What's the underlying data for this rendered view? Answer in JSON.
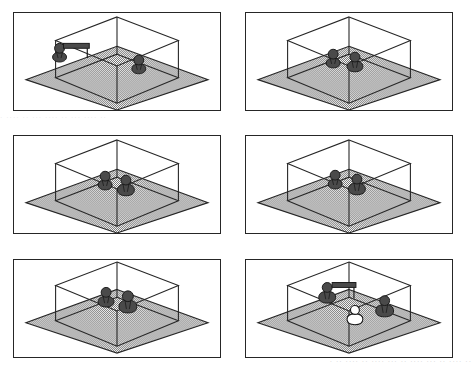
{
  "document": {
    "title": "Isometric cube scenes with pawn figures",
    "layout": "2 columns x 3 rows grid of bordered panels",
    "width": 476,
    "height": 371
  },
  "style": {
    "background_color": "#ffffff",
    "line_color": "#262626",
    "panel_border_color": "#262626",
    "floor_fill": "#8a8a8a",
    "floor_pattern": "dithered-checkerboard-gray",
    "pawn_dark_fill": "#4a4a4a",
    "pawn_light_fill": "#ffffff",
    "pawn_outline": "#1a1a1a"
  },
  "scene_common": {
    "cube_label": "wireframe-cube",
    "floor_label": "ground-plane-diamond",
    "projection": "isometric",
    "cube_edges": 12,
    "notes": "Transparent wireframe box sits on a larger shaded ground diamond."
  },
  "panels": [
    {
      "id": "panel-1",
      "position": "row1-col1",
      "figure_count": 2,
      "figures": [
        {
          "name": "pawn-dark-left",
          "color": "dark",
          "x": 46,
          "y": 50,
          "scale": 1.0,
          "has_bar": true,
          "bar_label": "horizontal-connector-bar"
        },
        {
          "name": "pawn-dark-right",
          "color": "dark",
          "x": 126,
          "y": 62,
          "scale": 1.0,
          "has_bar": false
        }
      ],
      "arrangement": "two pawns far apart, left pawn carries a bar"
    },
    {
      "id": "panel-2",
      "position": "row1-col2",
      "figure_count": 2,
      "figures": [
        {
          "name": "pawn-dark-left",
          "color": "dark",
          "x": 88,
          "y": 56,
          "scale": 1.0,
          "has_bar": false
        },
        {
          "name": "pawn-dark-right",
          "color": "dark",
          "x": 110,
          "y": 60,
          "scale": 1.0,
          "has_bar": false
        }
      ],
      "arrangement": "two pawns adjacent at centre"
    },
    {
      "id": "panel-3",
      "position": "row2-col1",
      "figure_count": 2,
      "figures": [
        {
          "name": "pawn-dark-left",
          "color": "dark",
          "x": 92,
          "y": 55,
          "scale": 1.0,
          "has_bar": false
        },
        {
          "name": "pawn-dark-right",
          "color": "dark",
          "x": 113,
          "y": 61,
          "scale": 1.05,
          "has_bar": false
        }
      ],
      "arrangement": "two pawns adjacent, right one slightly forward"
    },
    {
      "id": "panel-4",
      "position": "row2-col2",
      "figure_count": 2,
      "figures": [
        {
          "name": "pawn-dark-left",
          "color": "dark",
          "x": 90,
          "y": 54,
          "scale": 1.0,
          "has_bar": false
        },
        {
          "name": "pawn-dark-right",
          "color": "dark",
          "x": 112,
          "y": 60,
          "scale": 1.05,
          "has_bar": false
        }
      ],
      "arrangement": "two pawns adjacent at centre"
    },
    {
      "id": "panel-5",
      "position": "row3-col1",
      "figure_count": 2,
      "figures": [
        {
          "name": "pawn-dark-left",
          "color": "dark",
          "x": 93,
          "y": 48,
          "scale": 1.0,
          "has_bar": false
        },
        {
          "name": "pawn-dark-right",
          "color": "dark",
          "x": 115,
          "y": 54,
          "scale": 1.05,
          "has_bar": false
        }
      ],
      "arrangement": "two pawns adjacent, raised position"
    },
    {
      "id": "panel-6",
      "position": "row3-col2",
      "figure_count": 3,
      "figures": [
        {
          "name": "pawn-dark-back",
          "color": "dark",
          "x": 82,
          "y": 44,
          "scale": 1.0,
          "has_bar": true,
          "bar_label": "horizontal-connector-bar"
        },
        {
          "name": "pawn-light-front",
          "color": "light",
          "x": 110,
          "y": 66,
          "scale": 0.92,
          "has_bar": false
        },
        {
          "name": "pawn-dark-right",
          "color": "dark",
          "x": 140,
          "y": 58,
          "scale": 1.0,
          "has_bar": false
        }
      ],
      "arrangement": "dark pawn with bar at back-left, white pawn and dark pawn at front-right"
    }
  ],
  "artifacts": {
    "bottom_scan_text": "· ·· ···· ·· ···· ··· ·· ···· ··· ·· ···· ··",
    "mid_scan_text": "· ···· ·· ··· ···· ·· ··· ···· ··"
  }
}
